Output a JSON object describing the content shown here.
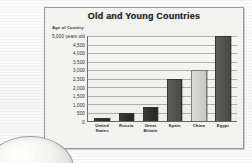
{
  "chart_data": {
    "type": "bar",
    "title": "Old and Young Countries",
    "ylabel": "Age of Country",
    "xlabel": "",
    "categories": [
      "United States",
      "Russia",
      "Great Britain",
      "Spain",
      "China",
      "Egypt"
    ],
    "values": [
      200,
      500,
      800,
      2500,
      3000,
      5000
    ],
    "ylim": [
      0,
      5000
    ],
    "ytick_values": [
      0,
      500,
      1000,
      1500,
      2000,
      2500,
      3000,
      3500,
      4000,
      4500,
      5000
    ],
    "ytick_labels": [
      "0",
      "500",
      "1,000",
      "1,500",
      "2,000",
      "2,500",
      "3,000",
      "3,500",
      "4,000",
      "4,500",
      "5,000 years old"
    ],
    "grid": true,
    "legend": "none",
    "bar_shades": [
      "dark",
      "dark",
      "dark",
      "mid",
      "light",
      "mid"
    ],
    "series": [
      {
        "name": "Age of Country",
        "values": [
          200,
          500,
          800,
          2500,
          3000,
          5000
        ]
      }
    ]
  },
  "colors": {
    "panel_background": "#f2f2f0",
    "panel_border": "#9a9a96",
    "plot_background": "#f6f6f4",
    "gridline": "#78786f",
    "axis": "#4a4a47",
    "title_text": "#1d1d1d",
    "tick_text": "#2e2e2c",
    "bar_dark": "#2e2e2a",
    "bar_mid": "#525250",
    "bar_light": "#cfcfcb"
  },
  "illustration": {
    "globe_name": "globe-illustration"
  },
  "caption": {
    "text": ""
  }
}
